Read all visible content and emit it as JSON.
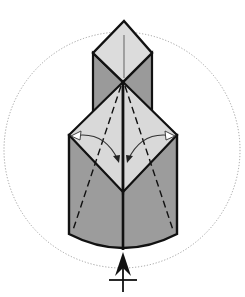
{
  "diagram": {
    "type": "origami-fold-step",
    "colors": {
      "background": "#ffffff",
      "light_face": "#d9d9d9",
      "dark_face": "#9a9a9a",
      "lines": "#111111",
      "guide_circle": "#888888"
    },
    "elements": {
      "guide_circle": "dotted",
      "upper_diamond": "light",
      "upper_walls": "dark",
      "lower_diamond_left": "light",
      "lower_diamond_right": "light",
      "lower_walls": "dark",
      "dashed_valley_folds": 4,
      "fold_arrows": 2,
      "bottom_symbol": "arrow-with-crossbar"
    }
  }
}
